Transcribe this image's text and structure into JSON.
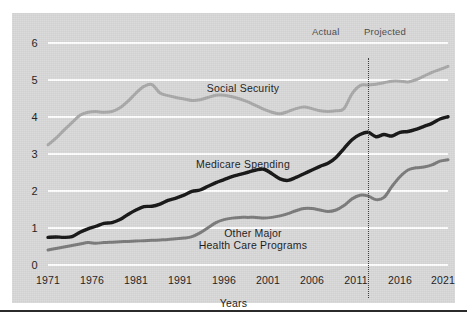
{
  "chart_data": {
    "type": "line",
    "title": "",
    "xlabel": "Years",
    "ylabel": "",
    "xlim": [
      1971,
      2021
    ],
    "ylim": [
      0,
      6
    ],
    "grid": true,
    "legend": "inline-labels",
    "y_ticks": [
      "6",
      "5",
      "4",
      "3",
      "2",
      "1",
      "0"
    ],
    "x_ticks": [
      "1971",
      "1976",
      "1981",
      "1991",
      "1996",
      "2001",
      "2006",
      "2011",
      "2016",
      "2021"
    ],
    "annotations": [
      {
        "name": "actual",
        "text": "Actual"
      },
      {
        "name": "projected",
        "text": "Projected"
      },
      {
        "name": "divider",
        "text": "",
        "x": 2011
      }
    ],
    "x": [
      1971,
      1972,
      1973,
      1974,
      1975,
      1976,
      1977,
      1978,
      1979,
      1980,
      1981,
      1982,
      1983,
      1984,
      1985,
      1986,
      1987,
      1988,
      1989,
      1990,
      1991,
      1992,
      1993,
      1994,
      1995,
      1996,
      1997,
      1998,
      1999,
      2000,
      2001,
      2002,
      2003,
      2004,
      2005,
      2006,
      2007,
      2008,
      2009,
      2010,
      2011,
      2012,
      2013,
      2014,
      2015,
      2016,
      2017,
      2018,
      2019,
      2020,
      2021
    ],
    "series": [
      {
        "name": "Social Security",
        "color": "#a9a9a9",
        "width": 3.0,
        "values": [
          3.22,
          3.4,
          3.62,
          3.82,
          4.02,
          4.1,
          4.12,
          4.1,
          4.12,
          4.22,
          4.4,
          4.62,
          4.8,
          4.85,
          4.62,
          4.55,
          4.5,
          4.46,
          4.42,
          4.44,
          4.5,
          4.56,
          4.56,
          4.52,
          4.46,
          4.38,
          4.28,
          4.18,
          4.1,
          4.06,
          4.12,
          4.2,
          4.24,
          4.2,
          4.14,
          4.12,
          4.14,
          4.2,
          4.6,
          4.82,
          4.84,
          4.86,
          4.9,
          4.94,
          4.94,
          4.92,
          4.98,
          5.08,
          5.18,
          5.26,
          5.34
        ]
      },
      {
        "name": "Medicare Spending",
        "color": "#151515",
        "width": 3.4,
        "values": [
          0.72,
          0.73,
          0.72,
          0.74,
          0.86,
          0.95,
          1.02,
          1.1,
          1.12,
          1.2,
          1.34,
          1.46,
          1.55,
          1.56,
          1.62,
          1.72,
          1.78,
          1.86,
          1.96,
          2.0,
          2.1,
          2.2,
          2.28,
          2.36,
          2.42,
          2.48,
          2.54,
          2.56,
          2.44,
          2.3,
          2.26,
          2.34,
          2.44,
          2.54,
          2.64,
          2.72,
          2.88,
          3.12,
          3.36,
          3.5,
          3.56,
          3.44,
          3.5,
          3.46,
          3.56,
          3.58,
          3.64,
          3.72,
          3.8,
          3.92,
          3.98
        ]
      },
      {
        "name": "Other Major Health Care Programs",
        "color": "#7b7b7b",
        "width": 3.0,
        "values": [
          0.38,
          0.42,
          0.46,
          0.5,
          0.54,
          0.58,
          0.56,
          0.58,
          0.59,
          0.6,
          0.61,
          0.62,
          0.63,
          0.64,
          0.65,
          0.66,
          0.68,
          0.7,
          0.74,
          0.84,
          0.98,
          1.12,
          1.2,
          1.24,
          1.26,
          1.26,
          1.26,
          1.24,
          1.26,
          1.3,
          1.36,
          1.44,
          1.5,
          1.5,
          1.46,
          1.42,
          1.46,
          1.58,
          1.76,
          1.86,
          1.84,
          1.74,
          1.8,
          2.1,
          2.36,
          2.54,
          2.6,
          2.62,
          2.68,
          2.78,
          2.82
        ]
      }
    ],
    "series_labels": [
      {
        "name": "social-security",
        "text": "Social Security"
      },
      {
        "name": "medicare-spending",
        "text": "Medicare Spending"
      },
      {
        "name": "other-major-line1",
        "text": "Other Major"
      },
      {
        "name": "other-major-line2",
        "text": "Health Care Programs"
      }
    ],
    "colors": {
      "panel": "#d9d9d9",
      "gridline": "#ffffff",
      "social_security": "#a9a9a9",
      "medicare": "#151515",
      "other_major": "#7b7b7b",
      "divider": "#3a3a3a",
      "text": "#1c1c1c"
    }
  }
}
